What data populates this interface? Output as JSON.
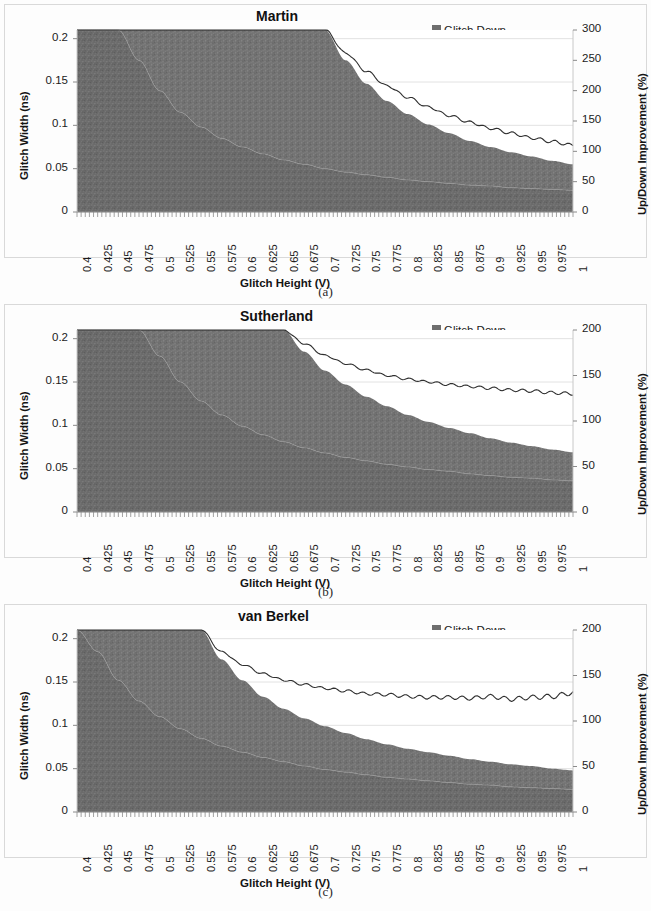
{
  "figure": {
    "panels": [
      {
        "id": "a",
        "caption": "(a)",
        "title": "Martin",
        "xlabel": "Glitch Height (V)",
        "ylabel_left": "Glitch Width (ns)",
        "ylabel_right": "Up/Down Improvement (%)",
        "yticks_left": [
          "0",
          "0.05",
          "0.1",
          "0.15",
          "0.2"
        ],
        "yticks_right": [
          "0",
          "50",
          "100",
          "150",
          "200",
          "250",
          "300"
        ],
        "legend": [
          {
            "label": "Glitch Down",
            "type": "area",
            "color": "#6e6e6e"
          },
          {
            "label": "Glitch Up",
            "type": "area",
            "color": "#7c7c7c"
          },
          {
            "label": "Improvement",
            "type": "line",
            "color": "#2b2b2b"
          }
        ]
      },
      {
        "id": "b",
        "caption": "(b)",
        "title": "Sutherland",
        "xlabel": "Glitch Height (V)",
        "ylabel_left": "Glitch Width (ns)",
        "ylabel_right": "Up/Down Improvement (%)",
        "yticks_left": [
          "0",
          "0.05",
          "0.1",
          "0.15",
          "0.2"
        ],
        "yticks_right": [
          "0",
          "50",
          "100",
          "150",
          "200"
        ],
        "legend": [
          {
            "label": "Glitch Down",
            "type": "area",
            "color": "#6e6e6e"
          },
          {
            "label": "Glitch Up",
            "type": "area",
            "color": "#7c7c7c"
          },
          {
            "label": "Improvement",
            "type": "line",
            "color": "#2b2b2b"
          }
        ]
      },
      {
        "id": "c",
        "caption": "(c)",
        "title": "van Berkel",
        "xlabel": "Glitch Height (V)",
        "ylabel_left": "Glitch Width (ns)",
        "ylabel_right": "Up/Down Improvement (%)",
        "yticks_left": [
          "0",
          "0.05",
          "0.1",
          "0.15",
          "0.2"
        ],
        "yticks_right": [
          "0",
          "50",
          "100",
          "150",
          "200"
        ],
        "legend": [
          {
            "label": "Glitch Down",
            "type": "area",
            "color": "#6e6e6e"
          },
          {
            "label": "Glitch Up",
            "type": "area",
            "color": "#7c7c7c"
          },
          {
            "label": "Improvement",
            "type": "line",
            "color": "#2b2b2b"
          }
        ]
      }
    ]
  },
  "chart_data": [
    {
      "type": "area",
      "panel": "a",
      "title": "Martin",
      "xlabel": "Glitch Height (V)",
      "ylabel": "Glitch Width (ns)",
      "ylabel_secondary": "Up/Down Improvement (%)",
      "xlim": [
        0.4,
        1.0
      ],
      "ylim": [
        0,
        0.21
      ],
      "ylim_secondary": [
        0,
        300
      ],
      "xticks": [
        0.4,
        0.425,
        0.45,
        0.475,
        0.5,
        0.525,
        0.55,
        0.575,
        0.6,
        0.625,
        0.65,
        0.675,
        0.7,
        0.725,
        0.75,
        0.775,
        0.8,
        0.825,
        0.85,
        0.875,
        0.9,
        0.925,
        0.95,
        0.975,
        1
      ],
      "yticks": [
        0,
        0.05,
        0.1,
        0.15,
        0.2
      ],
      "yticks_secondary": [
        0,
        50,
        100,
        150,
        200,
        250,
        300
      ],
      "grid": true,
      "legend_position": "top-right",
      "x": [
        0.4,
        0.425,
        0.45,
        0.475,
        0.5,
        0.525,
        0.55,
        0.575,
        0.6,
        0.625,
        0.65,
        0.675,
        0.7,
        0.725,
        0.75,
        0.775,
        0.8,
        0.825,
        0.85,
        0.875,
        0.9,
        0.925,
        0.95,
        0.975,
        1.0
      ],
      "series": [
        {
          "name": "Glitch Up",
          "kind": "area_upper",
          "units": "ns",
          "values": [
            0.21,
            0.21,
            0.21,
            0.21,
            0.21,
            0.21,
            0.21,
            0.21,
            0.21,
            0.21,
            0.21,
            0.21,
            0.21,
            0.175,
            0.148,
            0.128,
            0.113,
            0.101,
            0.091,
            0.082,
            0.075,
            0.069,
            0.064,
            0.059,
            0.055
          ]
        },
        {
          "name": "Glitch Down",
          "kind": "area_lower",
          "units": "ns",
          "values": [
            0.21,
            0.21,
            0.21,
            0.175,
            0.14,
            0.115,
            0.098,
            0.085,
            0.075,
            0.067,
            0.06,
            0.055,
            0.05,
            0.046,
            0.043,
            0.04,
            0.037,
            0.035,
            0.033,
            0.031,
            0.03,
            0.028,
            0.027,
            0.026,
            0.025
          ]
        },
        {
          "name": "Improvement",
          "kind": "line_secondary",
          "units": "%",
          "values": [
            300,
            300,
            300,
            300,
            300,
            300,
            300,
            300,
            300,
            300,
            300,
            300,
            300,
            262,
            232,
            208,
            189,
            173,
            159,
            148,
            138,
            130,
            122,
            116,
            110
          ]
        }
      ]
    },
    {
      "type": "area",
      "panel": "b",
      "title": "Sutherland",
      "xlabel": "Glitch Height (V)",
      "ylabel": "Glitch Width (ns)",
      "ylabel_secondary": "Up/Down Improvement (%)",
      "xlim": [
        0.4,
        1.0
      ],
      "ylim": [
        0,
        0.21
      ],
      "ylim_secondary": [
        0,
        200
      ],
      "xticks": [
        0.4,
        0.425,
        0.45,
        0.475,
        0.5,
        0.525,
        0.55,
        0.575,
        0.6,
        0.625,
        0.65,
        0.675,
        0.7,
        0.725,
        0.75,
        0.775,
        0.8,
        0.825,
        0.85,
        0.875,
        0.9,
        0.925,
        0.95,
        0.975,
        1
      ],
      "yticks": [
        0,
        0.05,
        0.1,
        0.15,
        0.2
      ],
      "yticks_secondary": [
        0,
        50,
        100,
        150,
        200
      ],
      "grid": true,
      "legend_position": "top-right",
      "x": [
        0.4,
        0.425,
        0.45,
        0.475,
        0.5,
        0.525,
        0.55,
        0.575,
        0.6,
        0.625,
        0.65,
        0.675,
        0.7,
        0.725,
        0.75,
        0.775,
        0.8,
        0.825,
        0.85,
        0.875,
        0.9,
        0.925,
        0.95,
        0.975,
        1.0
      ],
      "series": [
        {
          "name": "Glitch Up",
          "kind": "area_upper",
          "units": "ns",
          "values": [
            0.21,
            0.21,
            0.21,
            0.21,
            0.21,
            0.21,
            0.21,
            0.21,
            0.21,
            0.21,
            0.21,
            0.185,
            0.163,
            0.147,
            0.133,
            0.122,
            0.112,
            0.104,
            0.097,
            0.091,
            0.085,
            0.08,
            0.076,
            0.072,
            0.069
          ]
        },
        {
          "name": "Glitch Down",
          "kind": "area_lower",
          "units": "ns",
          "values": [
            0.21,
            0.21,
            0.21,
            0.21,
            0.18,
            0.15,
            0.128,
            0.112,
            0.099,
            0.089,
            0.081,
            0.074,
            0.068,
            0.063,
            0.059,
            0.055,
            0.052,
            0.049,
            0.047,
            0.044,
            0.042,
            0.04,
            0.039,
            0.037,
            0.036
          ]
        },
        {
          "name": "Improvement",
          "kind": "line_secondary",
          "units": "%",
          "values": [
            200,
            200,
            200,
            200,
            200,
            200,
            200,
            200,
            200,
            200,
            200,
            185,
            172,
            163,
            156,
            150,
            146,
            143,
            140,
            138,
            136,
            134,
            133,
            131,
            130
          ]
        }
      ]
    },
    {
      "type": "area",
      "panel": "c",
      "title": "van Berkel",
      "xlabel": "Glitch Height (V)",
      "ylabel": "Glitch Width (ns)",
      "ylabel_secondary": "Up/Down Improvement (%)",
      "xlim": [
        0.4,
        1.0
      ],
      "ylim": [
        0,
        0.21
      ],
      "ylim_secondary": [
        0,
        200
      ],
      "xticks": [
        0.4,
        0.425,
        0.45,
        0.475,
        0.5,
        0.525,
        0.55,
        0.575,
        0.6,
        0.625,
        0.65,
        0.675,
        0.7,
        0.725,
        0.75,
        0.775,
        0.8,
        0.825,
        0.85,
        0.875,
        0.9,
        0.925,
        0.95,
        0.975,
        1
      ],
      "yticks": [
        0,
        0.05,
        0.1,
        0.15,
        0.2
      ],
      "yticks_secondary": [
        0,
        50,
        100,
        150,
        200
      ],
      "grid": true,
      "legend_position": "top-right",
      "x": [
        0.4,
        0.425,
        0.45,
        0.475,
        0.5,
        0.525,
        0.55,
        0.575,
        0.6,
        0.625,
        0.65,
        0.675,
        0.7,
        0.725,
        0.75,
        0.775,
        0.8,
        0.825,
        0.85,
        0.875,
        0.9,
        0.925,
        0.95,
        0.975,
        1.0
      ],
      "series": [
        {
          "name": "Glitch Up",
          "kind": "area_upper",
          "units": "ns",
          "values": [
            0.21,
            0.21,
            0.21,
            0.21,
            0.21,
            0.21,
            0.21,
            0.176,
            0.152,
            0.133,
            0.119,
            0.108,
            0.099,
            0.091,
            0.084,
            0.078,
            0.073,
            0.069,
            0.065,
            0.061,
            0.058,
            0.055,
            0.053,
            0.05,
            0.048
          ]
        },
        {
          "name": "Glitch Down",
          "kind": "area_lower",
          "units": "ns",
          "values": [
            0.21,
            0.185,
            0.152,
            0.128,
            0.11,
            0.096,
            0.085,
            0.076,
            0.069,
            0.063,
            0.058,
            0.053,
            0.049,
            0.046,
            0.043,
            0.04,
            0.038,
            0.036,
            0.034,
            0.032,
            0.031,
            0.029,
            0.028,
            0.027,
            0.026
          ]
        },
        {
          "name": "Improvement",
          "kind": "line_secondary",
          "units": "%",
          "values": [
            200,
            200,
            200,
            200,
            200,
            200,
            200,
            176,
            162,
            152,
            145,
            140,
            136,
            133,
            130,
            129,
            127,
            126,
            126,
            125,
            127,
            124,
            126,
            127,
            131
          ]
        }
      ]
    }
  ]
}
